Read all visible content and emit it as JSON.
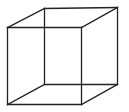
{
  "figure": {
    "background_color": "#ffffff",
    "line_color": "#222222",
    "faces": {
      "front": [
        "front-top-left",
        "front-top-right",
        "front-bottom-right",
        "front-bottom-left"
      ],
      "back": [
        "back-top-left",
        "back-top-right",
        "back-bottom-right",
        "back-bottom-left"
      ]
    },
    "edges": [
      {
        "name": "front-top-edge",
        "from": "front-top-left",
        "to": "front-top-right"
      },
      {
        "name": "front-right-edge",
        "from": "front-top-right",
        "to": "front-bottom-right"
      },
      {
        "name": "front-bottom-edge",
        "from": "front-bottom-right",
        "to": "front-bottom-left"
      },
      {
        "name": "front-left-edge",
        "from": "front-bottom-left",
        "to": "front-top-left"
      },
      {
        "name": "back-top-edge",
        "from": "back-top-left",
        "to": "back-top-right"
      },
      {
        "name": "back-right-edge",
        "from": "back-top-right",
        "to": "back-bottom-right"
      },
      {
        "name": "back-bottom-edge",
        "from": "back-bottom-right",
        "to": "back-bottom-left"
      },
      {
        "name": "back-left-edge",
        "from": "back-bottom-left",
        "to": "back-top-left"
      },
      {
        "name": "depth-top-left-edge",
        "from": "front-top-left",
        "to": "back-top-left"
      },
      {
        "name": "depth-top-right-edge",
        "from": "front-top-right",
        "to": "back-top-right"
      },
      {
        "name": "depth-bottom-right-edge",
        "from": "front-bottom-right",
        "to": "back-bottom-right"
      },
      {
        "name": "depth-bottom-left-edge",
        "from": "front-bottom-left",
        "to": "back-bottom-left"
      }
    ]
  }
}
